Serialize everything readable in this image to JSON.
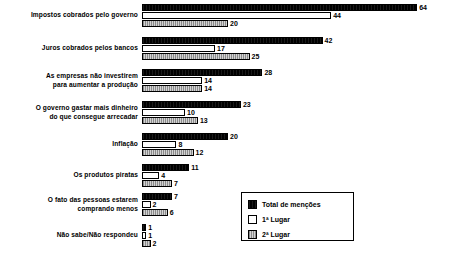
{
  "chart_data": {
    "type": "bar",
    "orientation": "horizontal",
    "title": "",
    "subtitle": "",
    "xlabel": "",
    "ylabel": "",
    "grid": false,
    "axis_visible": false,
    "xlim": [
      0,
      64
    ],
    "legend_position": "bottom-right",
    "value_labels": true,
    "categories": [
      "Impostos cobrados pelo governo",
      "Juros cobrados pelos bancos",
      "As empresas não investirem\npara aumentar a produção",
      "O governo gastar mais dinheiro\ndo que consegue arrecadar",
      "Inflação",
      "Os produtos piratas",
      "O fato das pessoas estarem\ncomprando menos",
      "Não sabe/Não respondeu"
    ],
    "series": [
      {
        "name": "Total de menções",
        "color": "#000000",
        "values": [
          64,
          42,
          28,
          23,
          20,
          11,
          7,
          1
        ]
      },
      {
        "name": "1ª Lugar",
        "color": "#ffffff",
        "values": [
          44,
          17,
          14,
          10,
          8,
          4,
          2,
          1
        ]
      },
      {
        "name": "2ª Lugar",
        "color": "#b4b4b4",
        "values": [
          20,
          25,
          14,
          13,
          12,
          7,
          6,
          2
        ]
      }
    ]
  },
  "legend": {
    "items": [
      {
        "label": "Total de menções",
        "swatch": "solid-black"
      },
      {
        "label": "1ª Lugar",
        "swatch": "white-outline"
      },
      {
        "label": "2ª Lugar",
        "swatch": "gray-hatched"
      }
    ]
  }
}
